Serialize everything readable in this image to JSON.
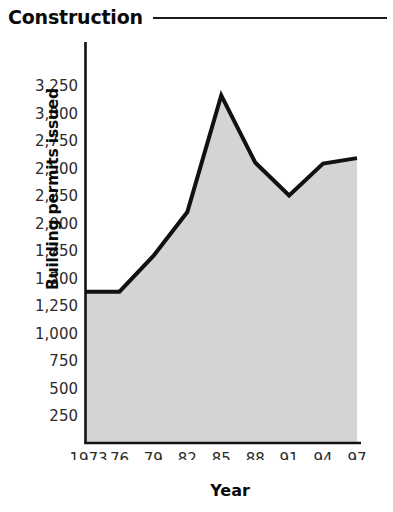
{
  "header": {
    "title": "Construction",
    "rule": "horizontal-rule"
  },
  "chart_data": {
    "type": "area",
    "title": "Construction",
    "xlabel": "Year",
    "ylabel": "Building permits issued",
    "x": [
      1973,
      1976,
      1979,
      1982,
      1985,
      1988,
      1991,
      1994,
      1997
    ],
    "categories": [
      "1973",
      "76",
      "79",
      "82",
      "85",
      "88",
      "91",
      "94",
      "97"
    ],
    "values": [
      1375,
      1375,
      1700,
      2100,
      3160,
      2550,
      2250,
      2540,
      2590
    ],
    "series": [
      {
        "name": "Building permits issued",
        "values": [
          1375,
          1375,
          1700,
          2100,
          3160,
          2550,
          2250,
          2540,
          2590
        ]
      }
    ],
    "ylim": [
      0,
      3250
    ],
    "xlim": [
      1973,
      1997
    ],
    "yticks": [
      250,
      500,
      750,
      1000,
      1250,
      1500,
      1750,
      2000,
      2250,
      2500,
      2750,
      3000,
      3250
    ],
    "ytick_labels": [
      "250",
      "500",
      "750",
      "1,000",
      "1,250",
      "1,500",
      "1,750",
      "2,000",
      "2,250",
      "2,500",
      "2,750",
      "3,000",
      "3,250"
    ],
    "xticks": [
      1973,
      1976,
      1979,
      1982,
      1985,
      1988,
      1991,
      1994,
      1997
    ],
    "xtick_labels": [
      "1973",
      "76",
      "79",
      "82",
      "85",
      "88",
      "91",
      "94",
      "97"
    ],
    "grid": false,
    "legend": "none",
    "colors": {
      "line": "#111111",
      "fill": "#d4d4d4",
      "axis": "#111111",
      "text": "#1a1a1a"
    }
  }
}
